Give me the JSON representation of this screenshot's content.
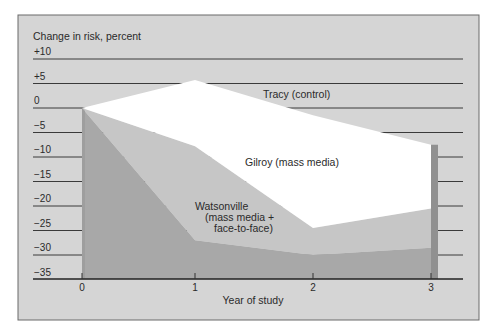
{
  "chart_data": {
    "type": "area",
    "title": "",
    "ylabel": "Change in risk, percent",
    "xlabel": "Year of study",
    "x": [
      0,
      1,
      2,
      3
    ],
    "x_tick_labels": [
      "0",
      "1",
      "2",
      "3"
    ],
    "y_tick_labels": [
      "+10",
      "+5",
      "0",
      "−5",
      "−10",
      "−15",
      "−20",
      "−25",
      "−30",
      "−35"
    ],
    "y_ticks": [
      10,
      5,
      0,
      -5,
      -10,
      -15,
      -20,
      -25,
      -30,
      -35
    ],
    "ylim": [
      -35,
      10
    ],
    "xlim": [
      0,
      3
    ],
    "grid": true,
    "series": [
      {
        "name": "Tracy (control)",
        "values": [
          0,
          5.7,
          -1.5,
          -7.5
        ],
        "color": "#ffffff"
      },
      {
        "name": "Gilroy (mass media)",
        "values": [
          0,
          -7.8,
          -24.5,
          -20.5
        ],
        "color": "#c6c6c6"
      },
      {
        "name": "Watsonville (mass media + face-to-face)",
        "values": [
          0,
          -27,
          -30,
          -28.5
        ],
        "color": "#a8a8a8"
      }
    ],
    "labels": {
      "tracy": "Tracy (control)",
      "gilroy": "Gilroy (mass media)",
      "watsonville_1": "Watsonville",
      "watsonville_2": "(mass media +",
      "watsonville_3": "face-to-face)"
    }
  },
  "colors": {
    "panel_bg": "#d5d5d5",
    "panel_border": "#6a6a6a",
    "gridline": "#3a3a3a",
    "side_strip": "#909090"
  }
}
